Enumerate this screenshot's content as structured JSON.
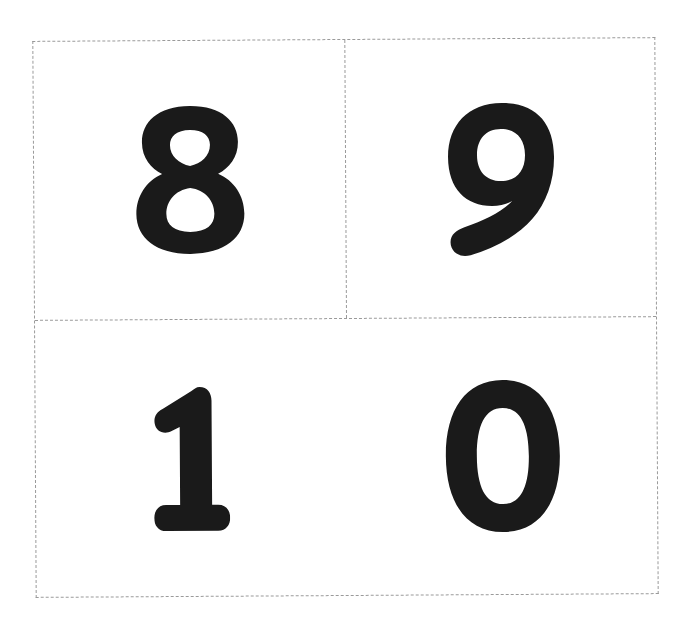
{
  "sheet": {
    "border_color": "#9a9a9a",
    "border_style": "dashed",
    "background": "#ffffff"
  },
  "cards": [
    {
      "position": "top-left",
      "digit": "8",
      "color": "#1a1a1a"
    },
    {
      "position": "top-right",
      "digit": "9",
      "color": "#1a1a1a"
    },
    {
      "position": "bottom-left",
      "digit": "1",
      "color": "#1a1a1a"
    },
    {
      "position": "bottom-right",
      "digit": "0",
      "color": "#1a1a1a"
    }
  ]
}
